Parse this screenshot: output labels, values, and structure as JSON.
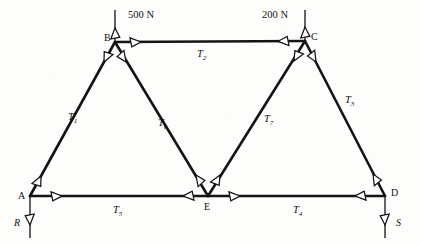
{
  "diagram": {
    "type": "truss-free-body-diagram",
    "background_color": "#fdfdfb",
    "line_color": "#141414",
    "arrowhead_fill": "#ffffff",
    "nodes": [
      {
        "id": "A",
        "label": "A",
        "x": 30,
        "y": 196,
        "label_x": 18,
        "label_y": 199
      },
      {
        "id": "B",
        "label": "B",
        "x": 115,
        "y": 42,
        "label_x": 104,
        "label_y": 41
      },
      {
        "id": "C",
        "label": "C",
        "x": 305,
        "y": 41,
        "label_x": 311,
        "label_y": 40
      },
      {
        "id": "D",
        "label": "D",
        "x": 385,
        "y": 196,
        "label_x": 391,
        "label_y": 196
      },
      {
        "id": "E",
        "label": "E",
        "x": 208,
        "y": 196,
        "label_x": 204,
        "label_y": 210
      }
    ],
    "members": [
      {
        "id": "T1",
        "label": "T",
        "subscript": "1",
        "from": "A",
        "to": "B",
        "label_x": 68,
        "label_y": 120
      },
      {
        "id": "T2",
        "label": "T",
        "subscript": "2",
        "from": "B",
        "to": "C",
        "label_x": 197,
        "label_y": 57
      },
      {
        "id": "T3",
        "label": "T",
        "subscript": "3",
        "from": "C",
        "to": "D",
        "label_x": 345,
        "label_y": 103
      },
      {
        "id": "T4",
        "label": "T",
        "subscript": "4",
        "from": "E",
        "to": "D",
        "label_x": 293,
        "label_y": 213
      },
      {
        "id": "T5",
        "label": "T",
        "subscript": "5",
        "from": "A",
        "to": "E",
        "label_x": 113,
        "label_y": 213
      },
      {
        "id": "T6",
        "label": "T",
        "subscript": "6",
        "from": "B",
        "to": "E",
        "label_x": 158,
        "label_y": 126
      },
      {
        "id": "T7",
        "label": "T",
        "subscript": "7",
        "from": "E",
        "to": "C",
        "label_x": 264,
        "label_y": 122
      }
    ],
    "applied_loads": [
      {
        "id": "load-b",
        "label": "500 N",
        "at_node": "B",
        "direction": "down",
        "label_x": 128,
        "label_y": 18
      },
      {
        "id": "load-c",
        "label": "200 N",
        "at_node": "C",
        "direction": "down",
        "label_x": 262,
        "label_y": 18
      }
    ],
    "reactions": [
      {
        "id": "reaction-r",
        "label": "R",
        "at_node": "A",
        "direction": "up",
        "label_x": 14,
        "label_y": 226
      },
      {
        "id": "reaction-s",
        "label": "S",
        "at_node": "D",
        "direction": "up",
        "label_x": 396,
        "label_y": 226
      }
    ]
  }
}
